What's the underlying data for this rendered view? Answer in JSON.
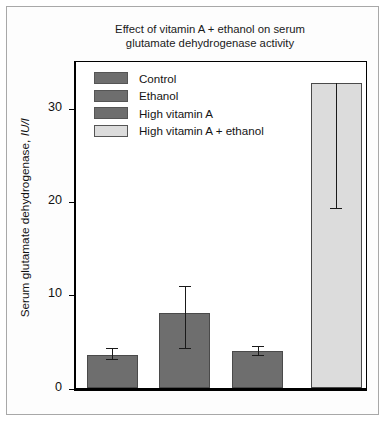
{
  "figure": {
    "background": "#ffffff",
    "frame_color": "#a8a8a8"
  },
  "chart_data": {
    "type": "bar",
    "title": "Effect of vitamin A + ethanol on serum glutamate dehydrogenase activity",
    "title_line1": "Effect of vitamin A + ethanol on serum",
    "title_line2": "glutamate dehydrogenase activity",
    "xlabel": "",
    "ylabel": "Serum glutamate dehydrogenase, IU/l",
    "ylabel_plain": "Serum glutamate dehydrogenase, ",
    "ylabel_italic": "IU/l",
    "ylim": [
      0,
      35
    ],
    "yticks": [
      0,
      10,
      20,
      30
    ],
    "ytick_labels": [
      "0",
      "10",
      "20",
      "30"
    ],
    "grid": false,
    "legend_position": "upper-left",
    "categories": [
      "Control",
      "Ethanol",
      "High vitamin A",
      "High vitamin A + ethanol"
    ],
    "values": [
      3.6,
      8.1,
      4.0,
      32.8
    ],
    "error_upper": [
      4.3,
      11.0,
      4.6,
      32.8
    ],
    "error_lower": [
      3.2,
      4.3,
      3.6,
      19.4
    ],
    "colors": [
      "#6e6e6e",
      "#6e6e6e",
      "#6e6e6e",
      "#dcdcdc"
    ],
    "bar_edge_color": "#4a4a4a",
    "error_bar_color": "#1a1a1a"
  },
  "legend": {
    "items": [
      {
        "label": "Control",
        "color": "#6e6e6e"
      },
      {
        "label": "Ethanol",
        "color": "#6e6e6e"
      },
      {
        "label": "High vitamin A",
        "color": "#6e6e6e"
      },
      {
        "label": "High vitamin A + ethanol",
        "color": "#dcdcdc"
      }
    ]
  }
}
